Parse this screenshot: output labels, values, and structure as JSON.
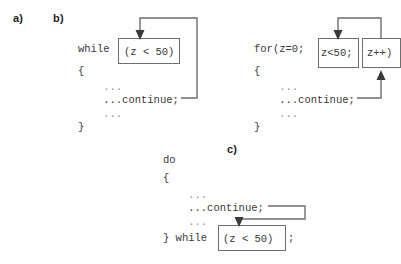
{
  "figure": {
    "background_color": "#fefefe",
    "line_color": "#6e6e6e",
    "text_color": "#3a3a3a"
  },
  "labels": {
    "a": "a)",
    "b": "b)",
    "c": "c)"
  },
  "blocks": {
    "while_loop": {
      "keyword": "while ",
      "condition": "(z < 50)",
      "lines": [
        "{",
        "    ...",
        "    ...continue;",
        "    ...",
        "}"
      ]
    },
    "for_loop": {
      "keyword": "for(z=0; ",
      "condition": "z<50;",
      "increment": "z++)",
      "lines": [
        "{",
        "    ...",
        "    ...continue;",
        "    ...",
        "}"
      ]
    },
    "do_while_loop": {
      "head": "do",
      "open_brace": "{",
      "lines": [
        "    ...",
        "    ...continue;",
        "    ..."
      ],
      "tail_prefix": "} while ",
      "condition": "(z < 50)",
      "tail_suffix": ";"
    }
  }
}
